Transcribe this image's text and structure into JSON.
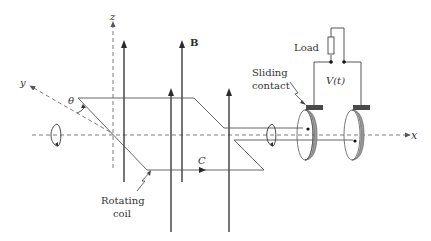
{
  "figure": {
    "colors": {
      "line": "#2b2b2b",
      "dashed": "#6e6e6e",
      "brush": "#4a4a4a",
      "ring_fill": "#9a9a9a",
      "text": "#333333"
    },
    "axes": {
      "x_label": "x",
      "y_label": "y",
      "z_label": "z"
    },
    "labels": {
      "field": "B",
      "angle": "θ",
      "contour": "C",
      "load": "Load",
      "voltage": "V(t)",
      "sliding_contact_line1": "Sliding",
      "sliding_contact_line2": "contact",
      "rotating_coil_line1": "Rotating",
      "rotating_coil_line2": "coil"
    },
    "components": [
      "magnetic field lines (4 upward arrows)",
      "rotating rectangular coil",
      "two slip rings",
      "two sliding contacts (brushes)",
      "load resistor",
      "rotation arrows on axis"
    ]
  }
}
